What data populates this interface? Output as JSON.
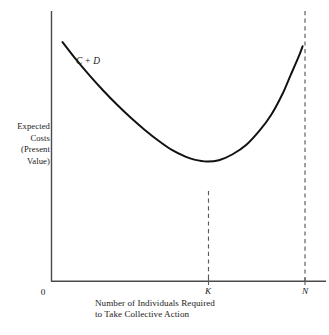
{
  "chart_data": {
    "type": "line",
    "title": "",
    "subtitle": "",
    "xlabel_lines": [
      "Number of Individuals Required",
      "to Take Collective Action"
    ],
    "ylabel_lines": [
      "Expected",
      "Costs",
      "(Present",
      "Value)"
    ],
    "xlabel": "Number of Individuals Required to Take Collective Action",
    "ylabel": "Expected Costs (Present Value)",
    "grid": false,
    "legend_position": "inline-annotation",
    "axis_origin_label": "0",
    "x_tick_labels": [
      "K",
      "N"
    ],
    "x_tick_values": [
      0.565,
      0.915
    ],
    "y_tick_labels": [],
    "xlim": [
      0,
      1
    ],
    "ylim": [
      0,
      1
    ],
    "series": [
      {
        "name": "C + D",
        "annotation": "C + D",
        "style": "solid",
        "color": "#111111",
        "x": [
          0.04,
          0.09,
          0.14,
          0.19,
          0.24,
          0.29,
          0.34,
          0.39,
          0.44,
          0.49,
          0.52,
          0.565,
          0.61,
          0.66,
          0.71,
          0.76,
          0.8,
          0.84,
          0.87,
          0.9,
          0.915
        ],
        "y": [
          0.885,
          0.82,
          0.76,
          0.704,
          0.652,
          0.604,
          0.56,
          0.52,
          0.485,
          0.46,
          0.45,
          0.443,
          0.448,
          0.47,
          0.505,
          0.56,
          0.615,
          0.69,
          0.76,
          0.83,
          0.87
        ]
      }
    ],
    "reference_lines": [
      {
        "name": "k-dashed-line",
        "axis": "x",
        "value": 0.565,
        "label": "K",
        "style": "dashed",
        "color": "#555555",
        "from_curve_to_axis": true
      },
      {
        "name": "n-dashed-line",
        "axis": "x",
        "value": 0.915,
        "label": "N",
        "style": "dashed",
        "color": "#555555",
        "from_top_to_axis": true
      }
    ],
    "annotations": [
      {
        "text": "C + D",
        "x": 0.135,
        "y": 0.795,
        "italic": true
      }
    ],
    "colors": {
      "curve": "#111111",
      "axis": "#4a4a4a",
      "dashed": "#5a5a5a",
      "text": "#1a1a1a",
      "background": "#ffffff"
    }
  },
  "axes": {
    "origin_label": "0",
    "x_caption": {
      "line1": "Number of Individuals Required",
      "line2": "to Take Collective Action"
    },
    "y_caption": {
      "line1": "Expected",
      "line2": "Costs",
      "line3": "(Present",
      "line4": "Value)"
    },
    "ticks": {
      "k": "K",
      "n": "N"
    }
  },
  "curve": {
    "label": "C + D"
  }
}
